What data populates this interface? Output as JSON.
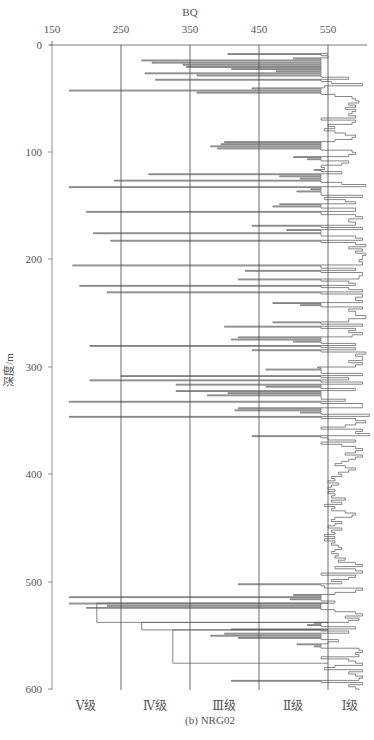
{
  "chart_data": {
    "type": "line",
    "orientation": "depth-profile (step)",
    "title": "BQ",
    "subtitle": "(b) NRG02",
    "xlabel": "BQ",
    "ylabel": "深度/m",
    "xlim": [
      150,
      610
    ],
    "ylim": [
      600,
      0
    ],
    "x_ticks": [
      150,
      250,
      350,
      450,
      550
    ],
    "y_ticks": [
      0,
      100,
      200,
      300,
      400,
      500,
      600
    ],
    "grid": {
      "vertical_lines_at": [
        250,
        350,
        450,
        550
      ],
      "horizontal": false
    },
    "legend": null,
    "class_bands": [
      {
        "label": "Ⅴ级",
        "range": [
          150,
          250
        ]
      },
      {
        "label": "Ⅳ级",
        "range": [
          250,
          350
        ]
      },
      {
        "label": "Ⅲ级",
        "range": [
          350,
          450
        ]
      },
      {
        "label": "Ⅱ级",
        "range": [
          450,
          550
        ]
      },
      {
        "label": "Ⅰ级",
        "range": [
          550,
          610
        ]
      }
    ],
    "series": [
      {
        "name": "NRG02 BQ",
        "points_depth_bq": [
          [
            8,
            405
          ],
          [
            10,
            550
          ],
          [
            12,
            500
          ],
          [
            14,
            280
          ],
          [
            16,
            295
          ],
          [
            18,
            340
          ],
          [
            20,
            345
          ],
          [
            22,
            410
          ],
          [
            24,
            475
          ],
          [
            26,
            285
          ],
          [
            28,
            360
          ],
          [
            30,
            580
          ],
          [
            32,
            300
          ],
          [
            34,
            555
          ],
          [
            36,
            600
          ],
          [
            38,
            545
          ],
          [
            40,
            440
          ],
          [
            42,
            175
          ],
          [
            44,
            360
          ],
          [
            46,
            560
          ],
          [
            48,
            585
          ],
          [
            50,
            590
          ],
          [
            52,
            595
          ],
          [
            54,
            580
          ],
          [
            56,
            590
          ],
          [
            58,
            575
          ],
          [
            60,
            590
          ],
          [
            62,
            585
          ],
          [
            64,
            580
          ],
          [
            66,
            590
          ],
          [
            68,
            540
          ],
          [
            70,
            590
          ],
          [
            72,
            585
          ],
          [
            74,
            550
          ],
          [
            76,
            560
          ],
          [
            78,
            545
          ],
          [
            80,
            560
          ],
          [
            82,
            575
          ],
          [
            84,
            590
          ],
          [
            86,
            585
          ],
          [
            88,
            560
          ],
          [
            90,
            400
          ],
          [
            92,
            395
          ],
          [
            94,
            380
          ],
          [
            96,
            390
          ],
          [
            98,
            585
          ],
          [
            100,
            590
          ],
          [
            102,
            580
          ],
          [
            104,
            500
          ],
          [
            106,
            520
          ],
          [
            108,
            580
          ],
          [
            110,
            570
          ],
          [
            112,
            540
          ],
          [
            114,
            545
          ],
          [
            116,
            530
          ],
          [
            118,
            570
          ],
          [
            120,
            290
          ],
          [
            122,
            480
          ],
          [
            124,
            510
          ],
          [
            126,
            240
          ],
          [
            128,
            570
          ],
          [
            130,
            605
          ],
          [
            132,
            175
          ],
          [
            134,
            525
          ],
          [
            136,
            505
          ],
          [
            138,
            540
          ],
          [
            140,
            600
          ],
          [
            142,
            545
          ],
          [
            144,
            575
          ],
          [
            146,
            590
          ],
          [
            148,
            480
          ],
          [
            150,
            470
          ],
          [
            152,
            590
          ],
          [
            155,
            200
          ],
          [
            158,
            590
          ],
          [
            160,
            600
          ],
          [
            162,
            580
          ],
          [
            165,
            590
          ],
          [
            168,
            440
          ],
          [
            170,
            600
          ],
          [
            172,
            490
          ],
          [
            175,
            210
          ],
          [
            178,
            590
          ],
          [
            180,
            600
          ],
          [
            182,
            235
          ],
          [
            184,
            590
          ],
          [
            186,
            605
          ],
          [
            188,
            580
          ],
          [
            190,
            600
          ],
          [
            192,
            590
          ],
          [
            194,
            605
          ],
          [
            196,
            600
          ],
          [
            198,
            600
          ],
          [
            200,
            595
          ],
          [
            202,
            600
          ],
          [
            205,
            180
          ],
          [
            208,
            590
          ],
          [
            210,
            430
          ],
          [
            212,
            600
          ],
          [
            215,
            595
          ],
          [
            218,
            420
          ],
          [
            220,
            580
          ],
          [
            222,
            590
          ],
          [
            224,
            190
          ],
          [
            226,
            580
          ],
          [
            228,
            600
          ],
          [
            230,
            230
          ],
          [
            232,
            600
          ],
          [
            235,
            590
          ],
          [
            238,
            600
          ],
          [
            240,
            470
          ],
          [
            242,
            510
          ],
          [
            244,
            600
          ],
          [
            246,
            580
          ],
          [
            248,
            590
          ],
          [
            250,
            590
          ],
          [
            252,
            605
          ],
          [
            255,
            580
          ],
          [
            258,
            470
          ],
          [
            260,
            600
          ],
          [
            262,
            400
          ],
          [
            264,
            590
          ],
          [
            266,
            580
          ],
          [
            268,
            600
          ],
          [
            270,
            585
          ],
          [
            272,
            420
          ],
          [
            274,
            410
          ],
          [
            276,
            500
          ],
          [
            278,
            590
          ],
          [
            280,
            205
          ],
          [
            282,
            590
          ],
          [
            284,
            440
          ],
          [
            286,
            605
          ],
          [
            288,
            590
          ],
          [
            290,
            600
          ],
          [
            292,
            600
          ],
          [
            294,
            580
          ],
          [
            296,
            600
          ],
          [
            298,
            590
          ],
          [
            300,
            535
          ],
          [
            302,
            460
          ],
          [
            304,
            540
          ],
          [
            306,
            600
          ],
          [
            308,
            250
          ],
          [
            310,
            580
          ],
          [
            312,
            205
          ],
          [
            314,
            600
          ],
          [
            316,
            330
          ],
          [
            318,
            460
          ],
          [
            320,
            590
          ],
          [
            322,
            330
          ],
          [
            324,
            405
          ],
          [
            326,
            375
          ],
          [
            328,
            540
          ],
          [
            330,
            575
          ],
          [
            332,
            175
          ],
          [
            334,
            600
          ],
          [
            336,
            600
          ],
          [
            338,
            420
          ],
          [
            340,
            415
          ],
          [
            342,
            510
          ],
          [
            344,
            610
          ],
          [
            346,
            175
          ],
          [
            348,
            590
          ],
          [
            350,
            605
          ],
          [
            352,
            590
          ],
          [
            354,
            575
          ],
          [
            356,
            540
          ],
          [
            358,
            600
          ],
          [
            360,
            590
          ],
          [
            362,
            610
          ],
          [
            364,
            440
          ],
          [
            366,
            550
          ],
          [
            368,
            590
          ],
          [
            370,
            540
          ],
          [
            372,
            570
          ],
          [
            374,
            590
          ],
          [
            376,
            600
          ],
          [
            378,
            590
          ],
          [
            380,
            575
          ],
          [
            382,
            600
          ],
          [
            384,
            590
          ],
          [
            386,
            580
          ],
          [
            388,
            570
          ],
          [
            390,
            560
          ],
          [
            392,
            575
          ],
          [
            394,
            590
          ],
          [
            396,
            580
          ],
          [
            398,
            565
          ],
          [
            400,
            570
          ],
          [
            402,
            555
          ],
          [
            404,
            560
          ],
          [
            406,
            550
          ],
          [
            408,
            565
          ],
          [
            410,
            555
          ],
          [
            412,
            550
          ],
          [
            414,
            560
          ],
          [
            416,
            550
          ],
          [
            418,
            560
          ],
          [
            420,
            555
          ],
          [
            422,
            575
          ],
          [
            424,
            555
          ],
          [
            426,
            570
          ],
          [
            428,
            545
          ],
          [
            430,
            560
          ],
          [
            432,
            555
          ],
          [
            434,
            575
          ],
          [
            436,
            590
          ],
          [
            438,
            585
          ],
          [
            440,
            560
          ],
          [
            442,
            555
          ],
          [
            444,
            570
          ],
          [
            446,
            560
          ],
          [
            448,
            550
          ],
          [
            450,
            570
          ],
          [
            452,
            555
          ],
          [
            454,
            560
          ],
          [
            456,
            545
          ],
          [
            458,
            560
          ],
          [
            460,
            545
          ],
          [
            462,
            560
          ],
          [
            464,
            555
          ],
          [
            466,
            565
          ],
          [
            468,
            570
          ],
          [
            470,
            560
          ],
          [
            472,
            555
          ],
          [
            474,
            565
          ],
          [
            476,
            560
          ],
          [
            478,
            575
          ],
          [
            480,
            565
          ],
          [
            482,
            590
          ],
          [
            484,
            600
          ],
          [
            486,
            560
          ],
          [
            488,
            590
          ],
          [
            490,
            600
          ],
          [
            492,
            540
          ],
          [
            494,
            590
          ],
          [
            496,
            580
          ],
          [
            498,
            555
          ],
          [
            500,
            570
          ],
          [
            502,
            420
          ],
          [
            504,
            545
          ],
          [
            506,
            600
          ],
          [
            508,
            590
          ],
          [
            510,
            560
          ],
          [
            512,
            500
          ],
          [
            514,
            175
          ],
          [
            516,
            495
          ],
          [
            518,
            560
          ],
          [
            520,
            175
          ],
          [
            522,
            230
          ],
          [
            524,
            200
          ],
          [
            526,
            560
          ],
          [
            528,
            590
          ],
          [
            530,
            600
          ],
          [
            532,
            575
          ],
          [
            534,
            595
          ],
          [
            536,
            580
          ],
          [
            538,
            530
          ],
          [
            540,
            520
          ],
          [
            542,
            590
          ],
          [
            544,
            410
          ],
          [
            546,
            580
          ],
          [
            548,
            400
          ],
          [
            550,
            380
          ],
          [
            552,
            420
          ],
          [
            554,
            565
          ],
          [
            556,
            550
          ],
          [
            558,
            505
          ],
          [
            560,
            530
          ],
          [
            562,
            595
          ],
          [
            564,
            600
          ],
          [
            566,
            590
          ],
          [
            568,
            595
          ],
          [
            570,
            540
          ],
          [
            572,
            580
          ],
          [
            574,
            590
          ],
          [
            576,
            600
          ],
          [
            578,
            560
          ],
          [
            580,
            545
          ],
          [
            582,
            600
          ],
          [
            584,
            580
          ],
          [
            586,
            590
          ],
          [
            588,
            600
          ],
          [
            590,
            595
          ],
          [
            592,
            410
          ],
          [
            594,
            600
          ],
          [
            596,
            580
          ],
          [
            598,
            590
          ],
          [
            600,
            595
          ]
        ]
      }
    ],
    "annotations": {
      "step_segment_deep": [
        {
          "depth_from": 520,
          "depth_to": 538,
          "bq": 215
        },
        {
          "depth_from": 538,
          "depth_to": 545,
          "bq": 280
        },
        {
          "depth_from": 545,
          "depth_to": 576,
          "bq": 325
        }
      ]
    }
  },
  "figure": {
    "top_axis_title": "BQ",
    "x_tick_labels": [
      "150",
      "250",
      "350",
      "450",
      "550"
    ],
    "y_tick_labels": [
      "0",
      "100",
      "200",
      "300",
      "400",
      "500",
      "600"
    ],
    "y_axis_label": "深度/m",
    "class_labels": [
      "Ⅴ级",
      "Ⅳ级",
      "Ⅲ级",
      "Ⅱ级",
      "Ⅰ级"
    ],
    "caption": "(b) NRG02"
  }
}
